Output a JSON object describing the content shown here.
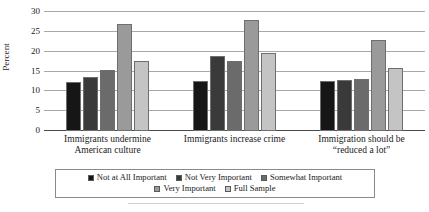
{
  "chart_data": {
    "type": "bar",
    "title": "",
    "xlabel": "",
    "ylabel": "Percent",
    "ylim": [
      0,
      30
    ],
    "ytick_step": 5,
    "yticks": [
      0,
      5,
      10,
      15,
      20,
      25,
      30
    ],
    "ytick_labels": [
      "0",
      "5",
      "10",
      "15",
      "20",
      "25",
      "30"
    ],
    "grid": "horizontal",
    "legend_position": "bottom",
    "categories": [
      "Immigrants undermine American culture",
      "Immigrants increase crime",
      "Immigration should be “reduced a lot”"
    ],
    "category_lines": [
      [
        "Immigrants undermine",
        "American culture"
      ],
      [
        "Immigrants increase crime"
      ],
      [
        "Immigration should be",
        "“reduced a lot”"
      ]
    ],
    "series": [
      {
        "name": "Not at All Important",
        "color": "#161616",
        "values": [
          12.3,
          12.6,
          12.6
        ]
      },
      {
        "name": "Not Very Important",
        "color": "#3a3a3a",
        "values": [
          13.6,
          19.0,
          12.9
        ]
      },
      {
        "name": "Somewhat Important",
        "color": "#6b6b6b",
        "values": [
          15.5,
          17.7,
          13.0
        ]
      },
      {
        "name": "Very Important",
        "color": "#9a9a9a",
        "values": [
          27.1,
          28.1,
          23.0
        ]
      },
      {
        "name": "Full Sample",
        "color": "#c4c4c4",
        "values": [
          17.6,
          19.7,
          16.0
        ]
      }
    ]
  },
  "legend": {
    "row1": [
      "Not at All Important",
      "Not Very Important",
      "Somewhat Important"
    ],
    "row2": [
      "Very Important",
      "Full Sample"
    ]
  },
  "colors": {
    "gridline": "#a8a8a8",
    "axis": "#4a4a4a",
    "bar_border": "#6e6e6e",
    "text": "#1a1a1a"
  }
}
